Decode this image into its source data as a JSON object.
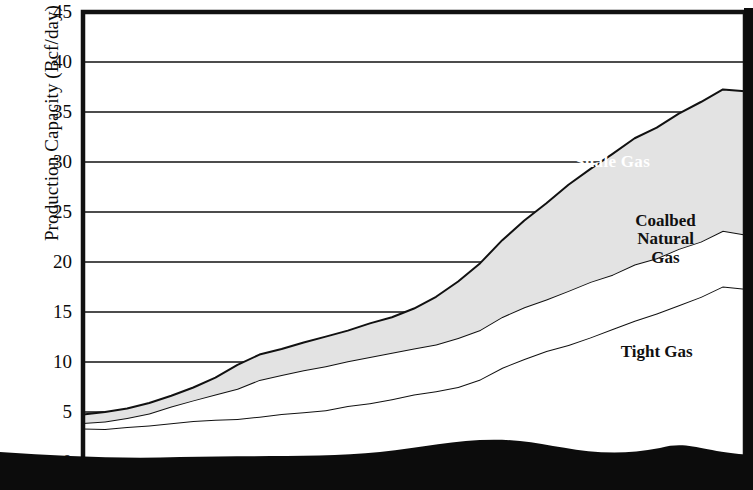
{
  "chart_data": {
    "type": "area",
    "title": "",
    "subtitle": "",
    "xlabel": "",
    "ylabel": "Production Capacity (Bcf/day)",
    "stacked": true,
    "grid": true,
    "grid_orientation": "horizontal",
    "legend_position": "inline-annotations",
    "xlim": [
      1989,
      2019
    ],
    "ylim": [
      0,
      45
    ],
    "yticks": [
      0,
      5,
      10,
      15,
      20,
      25,
      30,
      35,
      40,
      45
    ],
    "xticks": [
      1990,
      1992,
      1994,
      1996,
      1998,
      2000,
      2002,
      2004,
      2006,
      2008,
      2010,
      2012,
      2014,
      2016,
      2018
    ],
    "x": [
      1989,
      1990,
      1991,
      1992,
      1993,
      1994,
      1995,
      1996,
      1997,
      1998,
      1999,
      2000,
      2001,
      2002,
      2003,
      2004,
      2005,
      2006,
      2007,
      2008,
      2009,
      2010,
      2011,
      2012,
      2013,
      2014,
      2015,
      2016,
      2017,
      2018,
      2019
    ],
    "series": [
      {
        "name": "Tight Gas",
        "fill": "#ffffff",
        "stroke": "#111111",
        "values": [
          3.2,
          3.3,
          3.4,
          3.6,
          3.8,
          4.0,
          4.2,
          4.4,
          4.6,
          4.8,
          5.0,
          5.3,
          5.6,
          5.9,
          6.2,
          6.6,
          7.0,
          7.4,
          8.2,
          9.3,
          10.2,
          11.0,
          11.8,
          12.6,
          13.4,
          14.2,
          15.0,
          15.8,
          16.6,
          17.4,
          17.2
        ]
      },
      {
        "name": "Coalbed Natural Gas",
        "fill": "#ffffff",
        "stroke": "#111111",
        "values": [
          0.6,
          0.8,
          1.0,
          1.3,
          1.7,
          2.1,
          2.6,
          3.1,
          3.6,
          3.9,
          4.1,
          4.3,
          4.4,
          4.5,
          4.6,
          4.7,
          4.8,
          4.9,
          5.0,
          5.1,
          5.2,
          5.3,
          5.3,
          5.4,
          5.4,
          5.5,
          5.5,
          5.5,
          5.5,
          5.5,
          5.5
        ]
      },
      {
        "name": "Shale Gas",
        "fill": "#e3e3e3",
        "stroke": "#111111",
        "values": [
          1.0,
          0.9,
          0.9,
          0.9,
          1.0,
          1.2,
          1.6,
          2.3,
          2.6,
          2.7,
          2.8,
          3.0,
          3.2,
          3.4,
          3.6,
          4.0,
          4.7,
          5.5,
          6.6,
          7.6,
          8.6,
          9.6,
          10.6,
          11.4,
          12.1,
          12.7,
          13.2,
          13.6,
          14.0,
          14.3,
          14.4
        ]
      }
    ],
    "annotations": [
      {
        "id": "shale",
        "text": "Shale Gas",
        "x": 2013.0,
        "y": 30.0,
        "color": "#ffffff"
      },
      {
        "id": "coalbed",
        "text": "Coalbed\nNatural Gas",
        "x": 2015.4,
        "y": 22.2,
        "color": "#111111"
      },
      {
        "id": "tight",
        "text": "Tight Gas",
        "x": 2015.0,
        "y": 11.0,
        "color": "#111111"
      }
    ],
    "colors": {
      "shale_fill": "#e3e3e3",
      "coalbed_fill": "#ffffff",
      "tight_fill": "#ffffff",
      "axis": "#111111",
      "grid": "#111111",
      "text": "#0b0b0b"
    }
  }
}
